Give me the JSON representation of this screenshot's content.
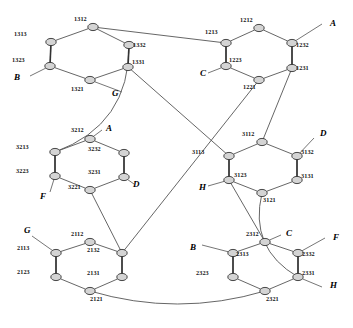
{
  "figure": {
    "background_color": "#ffffff",
    "node_fill": "#d4d4d4",
    "node_stroke": "#333333",
    "edge_color": "#555555"
  },
  "nodes": [
    {
      "id": "1313",
      "label": "1313",
      "cx": 51,
      "cy": 42,
      "lx": 14,
      "ly": 36,
      "anchor": "start"
    },
    {
      "id": "1312",
      "label": "1312",
      "cx": 93,
      "cy": 27,
      "lx": 74,
      "ly": 21,
      "anchor": "start"
    },
    {
      "id": "1332",
      "label": "1332",
      "cx": 129,
      "cy": 45,
      "lx": 133,
      "ly": 47,
      "anchor": "start"
    },
    {
      "id": "1323",
      "label": "1323",
      "cx": 50,
      "cy": 66,
      "lx": 12,
      "ly": 62,
      "anchor": "start"
    },
    {
      "id": "1331",
      "label": "1331",
      "cx": 128,
      "cy": 67,
      "lx": 132,
      "ly": 64,
      "anchor": "start"
    },
    {
      "id": "1321",
      "label": "1321",
      "cx": 90,
      "cy": 80,
      "lx": 71,
      "ly": 91,
      "anchor": "start"
    },
    {
      "id": "1213",
      "label": "1213",
      "cx": 226,
      "cy": 43,
      "lx": 205,
      "ly": 34,
      "anchor": "start"
    },
    {
      "id": "1212",
      "label": "1212",
      "cx": 259,
      "cy": 28,
      "lx": 240,
      "ly": 22,
      "anchor": "start"
    },
    {
      "id": "1232",
      "label": "1232",
      "cx": 292,
      "cy": 43,
      "lx": 296,
      "ly": 47,
      "anchor": "start"
    },
    {
      "id": "1223",
      "label": "1223",
      "cx": 226,
      "cy": 66,
      "lx": 229,
      "ly": 62,
      "anchor": "start"
    },
    {
      "id": "1231",
      "label": "1231",
      "cx": 292,
      "cy": 68,
      "lx": 296,
      "ly": 70,
      "anchor": "start"
    },
    {
      "id": "1221",
      "label": "1221",
      "cx": 259,
      "cy": 80,
      "lx": 243,
      "ly": 89,
      "anchor": "start"
    },
    {
      "id": "3213",
      "label": "3213",
      "cx": 55,
      "cy": 152,
      "lx": 16,
      "ly": 149,
      "anchor": "start"
    },
    {
      "id": "3212",
      "label": "3212",
      "cx": 90,
      "cy": 139,
      "lx": 71,
      "ly": 132,
      "anchor": "start"
    },
    {
      "id": "3232",
      "label": "3232",
      "cx": 124,
      "cy": 153,
      "lx": 88,
      "ly": 151,
      "anchor": "start"
    },
    {
      "id": "3223",
      "label": "3223",
      "cx": 55,
      "cy": 176,
      "lx": 16,
      "ly": 173,
      "anchor": "start"
    },
    {
      "id": "3231",
      "label": "3231",
      "cx": 124,
      "cy": 177,
      "lx": 88,
      "ly": 174,
      "anchor": "start"
    },
    {
      "id": "3221",
      "label": "3221",
      "cx": 90,
      "cy": 190,
      "lx": 68,
      "ly": 189,
      "anchor": "start"
    },
    {
      "id": "3113",
      "label": "3113",
      "cx": 229,
      "cy": 156,
      "lx": 192,
      "ly": 154,
      "anchor": "start"
    },
    {
      "id": "3112",
      "label": "3112",
      "cx": 262,
      "cy": 142,
      "lx": 242,
      "ly": 136,
      "anchor": "start"
    },
    {
      "id": "3132",
      "label": "3132",
      "cx": 297,
      "cy": 156,
      "lx": 301,
      "ly": 154,
      "anchor": "start"
    },
    {
      "id": "3123",
      "label": "3123",
      "cx": 229,
      "cy": 180,
      "lx": 234,
      "ly": 177,
      "anchor": "start"
    },
    {
      "id": "3131",
      "label": "3131",
      "cx": 297,
      "cy": 180,
      "lx": 301,
      "ly": 178,
      "anchor": "start"
    },
    {
      "id": "3121",
      "label": "3121",
      "cx": 262,
      "cy": 193,
      "lx": 263,
      "ly": 202,
      "anchor": "start"
    },
    {
      "id": "2113",
      "label": "2113",
      "cx": 56,
      "cy": 253,
      "lx": 17,
      "ly": 250,
      "anchor": "start"
    },
    {
      "id": "2112",
      "label": "2112",
      "cx": 90,
      "cy": 242,
      "lx": 71,
      "ly": 236,
      "anchor": "start"
    },
    {
      "id": "2132",
      "label": "2132",
      "cx": 122,
      "cy": 253,
      "lx": 87,
      "ly": 252,
      "anchor": "start"
    },
    {
      "id": "2123",
      "label": "2123",
      "cx": 56,
      "cy": 277,
      "lx": 17,
      "ly": 274,
      "anchor": "start"
    },
    {
      "id": "2131",
      "label": "2131",
      "cx": 122,
      "cy": 277,
      "lx": 87,
      "ly": 275,
      "anchor": "start"
    },
    {
      "id": "2121",
      "label": "2121",
      "cx": 90,
      "cy": 291,
      "lx": 90,
      "ly": 301,
      "anchor": "start"
    },
    {
      "id": "2313",
      "label": "2313",
      "cx": 233,
      "cy": 253,
      "lx": 236,
      "ly": 256,
      "anchor": "start"
    },
    {
      "id": "2312",
      "label": "2312",
      "cx": 265,
      "cy": 242,
      "lx": 246,
      "ly": 236,
      "anchor": "start"
    },
    {
      "id": "2332",
      "label": "2332",
      "cx": 298,
      "cy": 253,
      "lx": 302,
      "ly": 256,
      "anchor": "start"
    },
    {
      "id": "2323",
      "label": "2323",
      "cx": 233,
      "cy": 277,
      "lx": 196,
      "ly": 275,
      "anchor": "start"
    },
    {
      "id": "2331",
      "label": "2331",
      "cx": 298,
      "cy": 277,
      "lx": 302,
      "ly": 275,
      "anchor": "start"
    },
    {
      "id": "2321",
      "label": "2321",
      "cx": 265,
      "cy": 291,
      "lx": 266,
      "ly": 301,
      "anchor": "start"
    }
  ],
  "hex_edges": [
    [
      "1313",
      "1312"
    ],
    [
      "1312",
      "1332"
    ],
    [
      "1332",
      "1331"
    ],
    [
      "1331",
      "1321"
    ],
    [
      "1321",
      "1323"
    ],
    [
      "1323",
      "1313"
    ],
    [
      "1213",
      "1212"
    ],
    [
      "1212",
      "1232"
    ],
    [
      "1232",
      "1231"
    ],
    [
      "1231",
      "1221"
    ],
    [
      "1221",
      "1223"
    ],
    [
      "1223",
      "1213"
    ],
    [
      "3213",
      "3212"
    ],
    [
      "3212",
      "3232"
    ],
    [
      "3232",
      "3231"
    ],
    [
      "3231",
      "3221"
    ],
    [
      "3221",
      "3223"
    ],
    [
      "3223",
      "3213"
    ],
    [
      "3113",
      "3112"
    ],
    [
      "3112",
      "3132"
    ],
    [
      "3132",
      "3131"
    ],
    [
      "3131",
      "3121"
    ],
    [
      "3121",
      "3123"
    ],
    [
      "3123",
      "3113"
    ],
    [
      "2113",
      "2112"
    ],
    [
      "2112",
      "2132"
    ],
    [
      "2132",
      "2131"
    ],
    [
      "2131",
      "2121"
    ],
    [
      "2121",
      "2123"
    ],
    [
      "2123",
      "2113"
    ],
    [
      "2313",
      "2312"
    ],
    [
      "2312",
      "2332"
    ],
    [
      "2332",
      "2331"
    ],
    [
      "2331",
      "2321"
    ],
    [
      "2321",
      "2323"
    ],
    [
      "2323",
      "2313"
    ]
  ],
  "rung_edges": [
    [
      "1313",
      "1323"
    ],
    [
      "1332",
      "1331"
    ],
    [
      "1213",
      "1223"
    ],
    [
      "1232",
      "1231"
    ],
    [
      "3213",
      "3223"
    ],
    [
      "3232",
      "3231"
    ],
    [
      "3113",
      "3123"
    ],
    [
      "3132",
      "3131"
    ],
    [
      "2113",
      "2123"
    ],
    [
      "2132",
      "2131"
    ],
    [
      "2313",
      "2323"
    ],
    [
      "2332",
      "2331"
    ]
  ],
  "long_edges": [
    [
      "1312",
      "1213"
    ],
    [
      "1331",
      "3113"
    ],
    [
      "1221",
      "2132"
    ],
    [
      "3221",
      "2132"
    ],
    [
      "1231",
      "3112"
    ],
    [
      "3123",
      "2312"
    ]
  ],
  "curves": [
    {
      "from": "1332",
      "to": "3213",
      "name": "curve-1332-3213"
    },
    {
      "from": "2121",
      "to": "2321",
      "name": "curve-2121-2321"
    },
    {
      "from": "3121",
      "to": "2331",
      "name": "curve-3121-2331"
    }
  ],
  "port_labels": [
    {
      "text": "B",
      "x": 14,
      "y": 80,
      "from": [
        50,
        66
      ],
      "to": [
        30,
        76
      ],
      "name": "port-B-top-left"
    },
    {
      "text": "G",
      "x": 112,
      "y": 96,
      "from": [
        90,
        80
      ],
      "to": [
        122,
        92
      ],
      "name": "port-G-top-left"
    },
    {
      "text": "A",
      "x": 330,
      "y": 26,
      "from": [
        292,
        43
      ],
      "to": [
        322,
        24
      ],
      "name": "port-A-top-right"
    },
    {
      "text": "C",
      "x": 200,
      "y": 76,
      "from": [
        226,
        66
      ],
      "to": [
        208,
        73
      ],
      "name": "port-C-top-right"
    },
    {
      "text": "A",
      "x": 106,
      "y": 131,
      "from": [
        90,
        139
      ],
      "to": [
        102,
        130
      ],
      "name": "port-A-mid-left"
    },
    {
      "text": "D",
      "x": 133,
      "y": 187,
      "from": [
        124,
        177
      ],
      "to": [
        134,
        184
      ],
      "name": "port-D-mid-left"
    },
    {
      "text": "F",
      "x": 40,
      "y": 199,
      "from": [
        55,
        176
      ],
      "to": [
        50,
        192
      ],
      "name": "port-F-mid-left"
    },
    {
      "text": "D",
      "x": 320,
      "y": 136,
      "from": [
        297,
        156
      ],
      "to": [
        314,
        138
      ],
      "name": "port-D-mid-right"
    },
    {
      "text": "H",
      "x": 199,
      "y": 190,
      "from": [
        229,
        180
      ],
      "to": [
        208,
        186
      ],
      "name": "port-H-mid-right"
    },
    {
      "text": "G",
      "x": 24,
      "y": 233,
      "from": [
        56,
        253
      ],
      "to": [
        32,
        236
      ],
      "name": "port-G-bottom-left"
    },
    {
      "text": "B",
      "x": 190,
      "y": 250,
      "from": [
        233,
        253
      ],
      "to": [
        202,
        245
      ],
      "name": "port-B-bottom-right"
    },
    {
      "text": "C",
      "x": 286,
      "y": 236,
      "from": [
        265,
        242
      ],
      "to": [
        281,
        235
      ],
      "name": "port-C-bottom-right"
    },
    {
      "text": "F",
      "x": 333,
      "y": 240,
      "from": [
        298,
        253
      ],
      "to": [
        325,
        238
      ],
      "name": "port-F-bottom-right"
    },
    {
      "text": "H",
      "x": 330,
      "y": 288,
      "from": [
        298,
        277
      ],
      "to": [
        322,
        287
      ],
      "name": "port-H-bottom-right"
    }
  ]
}
